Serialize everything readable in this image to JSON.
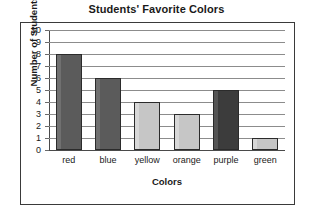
{
  "chart_data": {
    "type": "bar",
    "title": "Students' Favorite Colors",
    "xlabel": "Colors",
    "ylabel": "Number of Students",
    "categories": [
      "red",
      "blue",
      "yellow",
      "orange",
      "purple",
      "green"
    ],
    "values": [
      8,
      6,
      4,
      3,
      5,
      1
    ],
    "ylim": [
      0,
      10
    ],
    "ytick_labels": [
      "0",
      "1",
      "2",
      "3",
      "4",
      "5",
      "6",
      "7",
      "8",
      "9",
      "10"
    ],
    "ytick_values": [
      0,
      1,
      2,
      3,
      4,
      5,
      6,
      7,
      8,
      9,
      10
    ],
    "grid": true,
    "legend": false,
    "bar_shades": [
      "dark",
      "dark",
      "light",
      "light",
      "darkest",
      "light"
    ],
    "colors": {
      "bar_dark": "#5b5b5b",
      "bar_darkest": "#3c3c3c",
      "bar_light": "#c6c6c6",
      "bar_outline": "#2b2b2b",
      "gridline": "#8c8c8c",
      "axis": "#4a4a4a",
      "frame": "#3a3a3a",
      "text": "#1a1a1a",
      "background": "#ffffff"
    }
  }
}
